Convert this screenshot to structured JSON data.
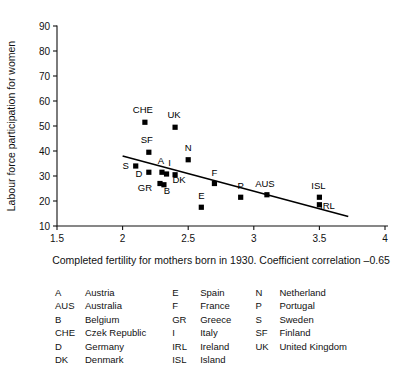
{
  "chart_data": {
    "type": "scatter",
    "title": "",
    "xlabel": "Completed fertility for mothers born in 1930. Coefficient correlation –0.65",
    "ylabel": "Labour force participation for women",
    "xlim": [
      1.5,
      4
    ],
    "ylim": [
      10,
      90
    ],
    "xticks": [
      "1.5",
      "2",
      "2.5",
      "3",
      "3.5",
      "4"
    ],
    "xtick_values": [
      1.5,
      2,
      2.5,
      3,
      3.5,
      4
    ],
    "yticks": [
      "10",
      "20",
      "30",
      "40",
      "50",
      "60",
      "70",
      "80",
      "90"
    ],
    "ytick_values": [
      10,
      20,
      30,
      40,
      50,
      60,
      70,
      80,
      90
    ],
    "grid": false,
    "legend_position": "below-plot",
    "marker": "filled-square",
    "points": [
      {
        "label": "CHE",
        "x": 2.17,
        "y": 51.5,
        "lx": -2,
        "ly": -9
      },
      {
        "label": "UK",
        "x": 2.4,
        "y": 49.5,
        "lx": -1,
        "ly": -9
      },
      {
        "label": "SF",
        "x": 2.2,
        "y": 39.5,
        "lx": -2,
        "ly": -9
      },
      {
        "label": "N",
        "x": 2.5,
        "y": 36.5,
        "lx": 0,
        "ly": -9
      },
      {
        "label": "S",
        "x": 2.1,
        "y": 34.0,
        "lx": -10,
        "ly": 3
      },
      {
        "label": "D",
        "x": 2.2,
        "y": 31.5,
        "lx": -10,
        "ly": 5
      },
      {
        "label": "A",
        "x": 2.3,
        "y": 31.5,
        "lx": -1,
        "ly": -8
      },
      {
        "label": "I",
        "x": 2.335,
        "y": 30.8,
        "lx": 3,
        "ly": -8
      },
      {
        "label": "DK",
        "x": 2.4,
        "y": 30.5,
        "lx": 4,
        "ly": 8
      },
      {
        "label": "GR",
        "x": 2.285,
        "y": 27.0,
        "lx": -15,
        "ly": 7
      },
      {
        "label": "B",
        "x": 2.315,
        "y": 26.5,
        "lx": 3,
        "ly": 9
      },
      {
        "label": "F",
        "x": 2.7,
        "y": 27.0,
        "lx": 0,
        "ly": -8
      },
      {
        "label": "E",
        "x": 2.6,
        "y": 17.5,
        "lx": 0,
        "ly": -8
      },
      {
        "label": "P",
        "x": 2.9,
        "y": 21.5,
        "lx": 0,
        "ly": -8
      },
      {
        "label": "AUS",
        "x": 3.1,
        "y": 22.5,
        "lx": -2,
        "ly": -8
      },
      {
        "label": "ISL",
        "x": 3.5,
        "y": 21.5,
        "lx": -1,
        "ly": -8
      },
      {
        "label": "IRL",
        "x": 3.5,
        "y": 18.5,
        "lx": 8,
        "ly": 4
      }
    ],
    "fit_line": {
      "x1": 2.0,
      "y1": 38.0,
      "x2": 3.72,
      "y2": 13.8
    },
    "correlation": "–0.65"
  },
  "legend": {
    "columns": [
      {
        "entries": [
          {
            "code": "A",
            "name": "Austria"
          },
          {
            "code": "AUS",
            "name": "Australia"
          },
          {
            "code": "B",
            "name": "Belgium"
          },
          {
            "code": "CHE",
            "name": "Czek Republic"
          },
          {
            "code": "D",
            "name": "Germany"
          },
          {
            "code": "DK",
            "name": "Denmark"
          }
        ]
      },
      {
        "entries": [
          {
            "code": "E",
            "name": "Spain"
          },
          {
            "code": "F",
            "name": "France"
          },
          {
            "code": "GR",
            "name": "Greece"
          },
          {
            "code": "I",
            "name": "Italy"
          },
          {
            "code": "IRL",
            "name": "Ireland"
          },
          {
            "code": "ISL",
            "name": "Island"
          }
        ]
      },
      {
        "entries": [
          {
            "code": "N",
            "name": "Netherland"
          },
          {
            "code": "P",
            "name": "Portugal"
          },
          {
            "code": "S",
            "name": "Sweden"
          },
          {
            "code": "SF",
            "name": "Finland"
          },
          {
            "code": "UK",
            "name": "United Kingdom"
          }
        ]
      }
    ]
  }
}
